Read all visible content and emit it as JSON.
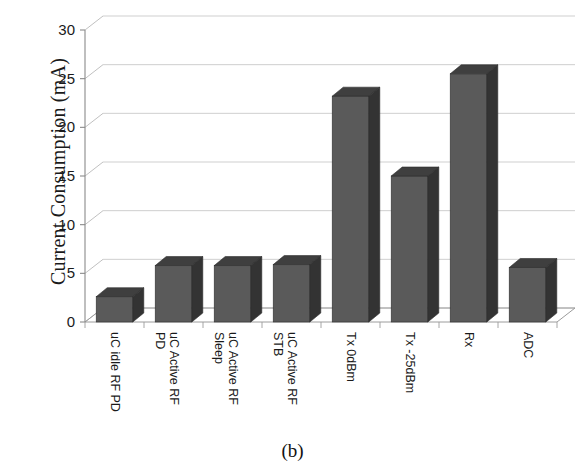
{
  "figure": {
    "caption": "(b)"
  },
  "chart_data": {
    "type": "bar",
    "title": "",
    "xlabel": "",
    "ylabel": "Current Consumption (mA)",
    "ylim": [
      0,
      30
    ],
    "ytick_values": [
      0,
      5,
      10,
      15,
      20,
      25,
      30
    ],
    "ytick_labels": [
      "0",
      "5",
      "10",
      "15",
      "20",
      "25",
      "30"
    ],
    "grid": true,
    "legend": "none",
    "style": "3d-column",
    "bar_color": "#5a5a5a",
    "bar_top_color": "#3f3f3f",
    "bar_side_color": "#333333",
    "categories": [
      "uC idle RF PD",
      "uC Active RF PD",
      "uC Active RF Sleep",
      "uC Active RF STB",
      "Tx 0dBm",
      "Tx -25dBm",
      "Rx",
      "ADC"
    ],
    "category_labels_wrapped": [
      "uC idle RF PD",
      "uC Active RF\nPD",
      "uC Active RF\nSleep",
      "uC Active RF\nSTB",
      "Tx 0dBm",
      "Tx -25dBm",
      "Rx",
      "ADC"
    ],
    "values": [
      2.6,
      5.8,
      5.8,
      5.9,
      23.2,
      15.0,
      25.5,
      5.6
    ],
    "units": "mA"
  }
}
